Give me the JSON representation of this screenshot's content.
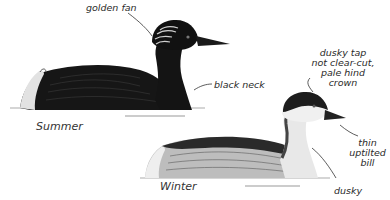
{
  "illustration": {
    "subject": "grebe, summer and winter plumage",
    "colors": {
      "ink": "#1a1a1a",
      "background": "#ffffff",
      "plumage_dark": "#151515",
      "plumage_grey": "#6e6e6e",
      "plumage_light": "#d8d8d8"
    }
  },
  "summer": {
    "season_label": "Summer",
    "annotations": {
      "crest": "golden fan",
      "neck": "black neck"
    }
  },
  "winter": {
    "season_label": "Winter",
    "annotations": {
      "cap_line1": "dusky tap",
      "cap_line2": "not clear-cut,",
      "cap_line3": "pale hind",
      "cap_line4": "crown",
      "bill_line1": "thin",
      "bill_line2": "uptilted",
      "bill_line3": "bill",
      "neck": "dusky"
    }
  }
}
